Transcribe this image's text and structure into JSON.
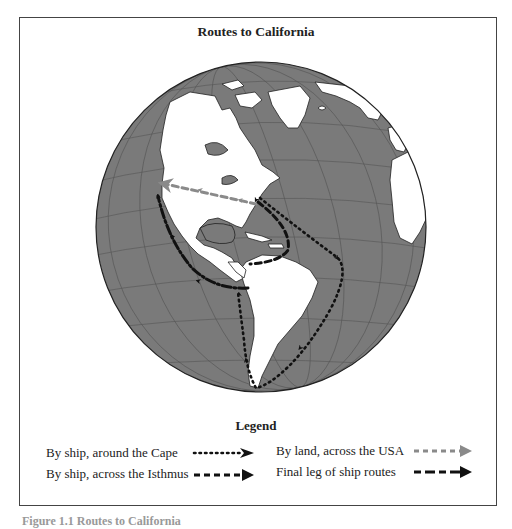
{
  "figure": {
    "title": "Routes to California",
    "caption": "Figure 1.1 Routes to California"
  },
  "map": {
    "projection": "orthographic globe centered on the Americas / Atlantic",
    "colors": {
      "ocean": "#7a7a7a",
      "land": "#ffffff",
      "graticule": "#555555",
      "outline": "#222222",
      "land_route": "#8a8a8a",
      "ship_route": "#111111"
    },
    "routes": [
      {
        "id": "cape",
        "label": "By ship, around the Cape",
        "style": "dotted",
        "color": "#111111",
        "from": "New York",
        "via": "Cape Horn",
        "to": "Panama (west coast)"
      },
      {
        "id": "isthmus",
        "label": "By ship, across the Isthmus",
        "style": "dashed",
        "color": "#111111",
        "from": "New York",
        "via": "Caribbean",
        "to": "Isthmus of Panama"
      },
      {
        "id": "land",
        "label": "By land, across the USA",
        "style": "dashed-gray",
        "color": "#8a8a8a",
        "from": "East coast",
        "to": "California"
      },
      {
        "id": "final",
        "label": "Final leg of ship routes",
        "style": "dash-dot",
        "color": "#111111",
        "from": "Panama",
        "to": "San Francisco"
      }
    ]
  },
  "legend": {
    "title": "Legend",
    "items": [
      {
        "label": "By ship, around the Cape",
        "style": "dotted"
      },
      {
        "label": "By ship, across the Isthmus",
        "style": "dashed"
      },
      {
        "label": "By land, across the USA",
        "style": "dashed-gray"
      },
      {
        "label": "Final leg of ship routes",
        "style": "dash-dot"
      }
    ]
  }
}
